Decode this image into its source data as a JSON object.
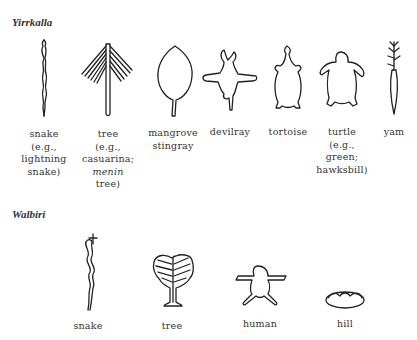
{
  "sections": [
    {
      "title": "Yirrkalla",
      "items": [
        {
          "icon": "snake-icon",
          "lines": [
            "snake",
            "(e.g.,",
            "lightning",
            "snake)"
          ]
        },
        {
          "icon": "tree-icon",
          "lines": [
            "tree",
            "(e.g.,",
            "casuarina;",
            "menin",
            "tree)"
          ],
          "italic_line_index": 3
        },
        {
          "icon": "stingray-icon",
          "lines": [
            "mangrove",
            "stingray"
          ]
        },
        {
          "icon": "devilray-icon",
          "lines": [
            "devilray"
          ]
        },
        {
          "icon": "tortoise-icon",
          "lines": [
            "tortoise"
          ]
        },
        {
          "icon": "turtle-icon",
          "lines": [
            "turtle",
            "(e.g.,",
            "green;",
            "hawksbill)"
          ]
        },
        {
          "icon": "yam-icon",
          "lines": [
            "yam"
          ]
        }
      ]
    },
    {
      "title": "Walbiri",
      "items": [
        {
          "icon": "snake-icon",
          "lines": [
            "snake"
          ]
        },
        {
          "icon": "tree-icon",
          "lines": [
            "tree"
          ]
        },
        {
          "icon": "human-icon",
          "lines": [
            "human"
          ]
        },
        {
          "icon": "hill-icon",
          "lines": [
            "hill"
          ]
        }
      ]
    }
  ]
}
